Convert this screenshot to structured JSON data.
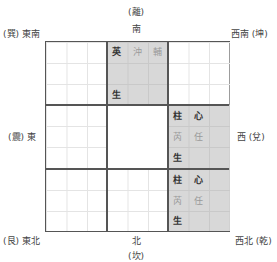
{
  "labels": {
    "top_trigram": "(離)",
    "top": "南",
    "top_left": "(巽) 東南",
    "top_right": "西南 (坤)",
    "left": "(震) 東",
    "right": "西 (兌)",
    "bottom_left": "(艮) 東北",
    "bottom": "北",
    "bottom_trigram": "(坎)",
    "bottom_right": "西北 (乾)"
  },
  "cells": {
    "south": {
      "row1": [
        "英",
        "沖",
        "輔"
      ],
      "row3": [
        "生"
      ]
    },
    "west": {
      "row1": [
        "柱",
        "心"
      ],
      "row2": [
        "芮",
        "任"
      ],
      "row3": [
        "生"
      ]
    },
    "northwest": {
      "row1": [
        "柱",
        "心"
      ],
      "row2": [
        "芮",
        "任"
      ],
      "row3": [
        "生"
      ]
    }
  },
  "colors": {
    "shade": "#d8d8d8",
    "line": "#555555",
    "faint_text": "#9a9a9a"
  }
}
